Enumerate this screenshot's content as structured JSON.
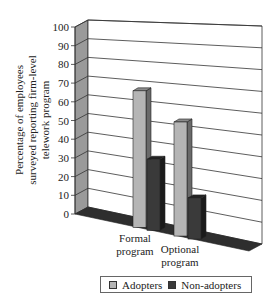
{
  "chart_data": {
    "type": "bar",
    "title": "",
    "xlabel": "",
    "ylabel": "Percentage of employees surveyed reporting firm-level telework program",
    "ylabel_lines": [
      "Percentage of employees",
      "surveyed reporting firm-level",
      "telework program"
    ],
    "categories": [
      "Formal program",
      "Optional program"
    ],
    "category_lines": [
      [
        "Formal",
        "program"
      ],
      [
        "Optional",
        "program"
      ]
    ],
    "series": [
      {
        "name": "Adopters",
        "values": [
          73,
          61
        ],
        "color": "#b5b5b5"
      },
      {
        "name": "Non-adopters",
        "values": [
          38,
          22
        ],
        "color": "#3a3a3a"
      }
    ],
    "ylim": [
      0,
      100
    ],
    "yticks": [
      0,
      10,
      20,
      30,
      40,
      50,
      60,
      70,
      80,
      90,
      100
    ],
    "grid": true,
    "style": "3d-column",
    "legend_position": "bottom"
  },
  "legend": {
    "items": [
      {
        "label": "Adopters",
        "color": "#b5b5b5"
      },
      {
        "label": "Non-adopters",
        "color": "#3a3a3a"
      }
    ]
  }
}
